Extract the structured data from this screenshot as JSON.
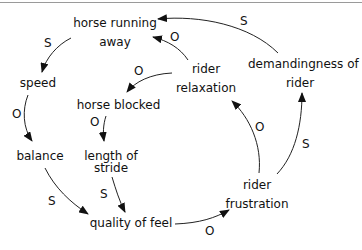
{
  "diagram": {
    "type": "causal loop diagram",
    "nodes": [
      {
        "id": "horse_running_away",
        "label_line1": "horse running",
        "label_line2": "away"
      },
      {
        "id": "speed",
        "label": "speed"
      },
      {
        "id": "balance",
        "label": "balance"
      },
      {
        "id": "horse_blocked",
        "label": "horse blocked"
      },
      {
        "id": "length_of_stride",
        "label_line1": "length of",
        "label_line2": "stride"
      },
      {
        "id": "quality_of_feel",
        "label": "quality of feel"
      },
      {
        "id": "rider_relaxation",
        "label_line1": "rider",
        "label_line2": "relaxation"
      },
      {
        "id": "demandingness_of_rider",
        "label_line1": "demandingness of",
        "label_line2": "rider"
      },
      {
        "id": "rider_frustration",
        "label_line1": "rider",
        "label_line2": "frustration"
      }
    ],
    "edges": [
      {
        "from": "horse_running_away",
        "to": "speed",
        "polarity": "S"
      },
      {
        "from": "speed",
        "to": "balance",
        "polarity": "O"
      },
      {
        "from": "balance",
        "to": "quality_of_feel",
        "polarity": "S"
      },
      {
        "from": "rider_relaxation",
        "to": "horse_blocked",
        "polarity": "O"
      },
      {
        "from": "horse_blocked",
        "to": "length_of_stride",
        "polarity": "O"
      },
      {
        "from": "length_of_stride",
        "to": "quality_of_feel",
        "polarity": "S"
      },
      {
        "from": "quality_of_feel",
        "to": "rider_frustration",
        "polarity": "O"
      },
      {
        "from": "rider_frustration",
        "to": "rider_relaxation",
        "polarity": "O"
      },
      {
        "from": "rider_frustration",
        "to": "demandingness_of_rider",
        "polarity": "S"
      },
      {
        "from": "rider_relaxation",
        "to": "horse_running_away",
        "polarity": "O"
      },
      {
        "from": "demandingness_of_rider",
        "to": "horse_running_away",
        "polarity": "S"
      }
    ]
  }
}
